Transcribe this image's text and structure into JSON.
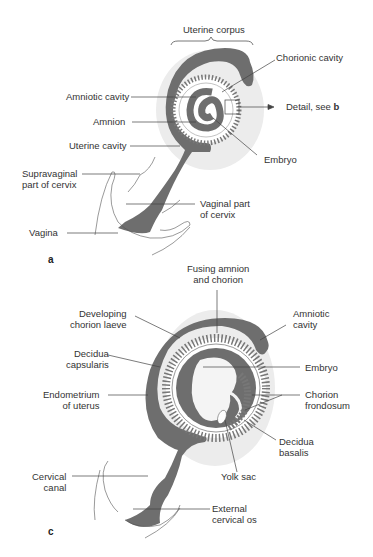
{
  "figure": {
    "panels": [
      {
        "id": "a",
        "labels": {
          "uterine_corpus": "Uterine corpus",
          "chorionic_cavity": "Chorionic cavity",
          "amniotic_cavity": "Amniotic cavity",
          "detail_prefix": "Detail, see ",
          "detail_ref": "b",
          "amnion": "Amnion",
          "uterine_cavity": "Uterine cavity",
          "embryo": "Embryo",
          "supravaginal_1": "Supravaginal",
          "supravaginal_2": "part of cervix",
          "vaginal_part_1": "Vaginal part",
          "vaginal_part_2": "of cervix",
          "vagina": "Vagina"
        }
      },
      {
        "id": "c",
        "labels": {
          "fusing_1": "Fusing amnion",
          "fusing_2": "and chorion",
          "developing_1": "Developing",
          "developing_2": "chorion laeve",
          "amniotic_1": "Amniotic",
          "amniotic_2": "cavity",
          "decidua_caps_1": "Decidua",
          "decidua_caps_2": "capsularis",
          "embryo": "Embryo",
          "endometrium_1": "Endometrium",
          "endometrium_2": "of uterus",
          "chorion_frond_1": "Chorion",
          "chorion_frond_2": "frondosum",
          "decidua_bas_1": "Decidua",
          "decidua_bas_2": "basalis",
          "yolk_sac": "Yolk sac",
          "cervical_canal_1": "Cervical",
          "cervical_canal_2": "canal",
          "external_os_1": "External",
          "external_os_2": "cervical os"
        }
      }
    ],
    "colors": {
      "tissue": "#6e6e6e",
      "halo": "#e6e6e6",
      "line": "#444444"
    }
  }
}
